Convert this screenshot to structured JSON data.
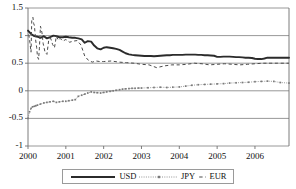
{
  "chart_data": {
    "type": "line",
    "title": "",
    "subtitle": "",
    "xlabel": "",
    "ylabel": "",
    "xlim": [
      2000.0,
      2006.9
    ],
    "ylim": [
      -1,
      1.5
    ],
    "grid": true,
    "grid_axis": "y",
    "legend_position": "bottom-center",
    "yticks": [
      1.5,
      1,
      0.5,
      0,
      -0.5,
      -1
    ],
    "ytick_labels": [
      "1.5",
      "1",
      "0.5",
      "0",
      "-0.5",
      "-1"
    ],
    "xticks": [
      2000,
      2001,
      2002,
      2003,
      2004,
      2005,
      2006
    ],
    "xtick_labels": [
      "2000",
      "2001",
      "2002",
      "2003",
      "2004",
      "2005",
      "2006"
    ],
    "series": [
      {
        "name": "USD",
        "style": "solid-thick",
        "color": "#2b2b2b",
        "x": [
          2000.0,
          2000.08,
          2000.17,
          2000.25,
          2000.33,
          2000.42,
          2000.5,
          2000.58,
          2000.67,
          2000.75,
          2000.83,
          2000.92,
          2001.0,
          2001.08,
          2001.17,
          2001.25,
          2001.33,
          2001.42,
          2001.5,
          2001.58,
          2001.67,
          2001.75,
          2001.83,
          2001.92,
          2002.0,
          2002.08,
          2002.17,
          2002.25,
          2002.33,
          2002.42,
          2002.5,
          2002.58,
          2002.67,
          2002.75,
          2002.83,
          2002.92,
          2003.0,
          2003.08,
          2003.17,
          2003.25,
          2003.33,
          2003.42,
          2003.5,
          2003.58,
          2003.67,
          2003.75,
          2003.83,
          2003.92,
          2004.0,
          2004.08,
          2004.17,
          2004.25,
          2004.33,
          2004.42,
          2004.5,
          2004.58,
          2004.67,
          2004.75,
          2004.83,
          2004.92,
          2005.0,
          2005.08,
          2005.17,
          2005.25,
          2005.33,
          2005.42,
          2005.5,
          2005.58,
          2005.67,
          2005.75,
          2005.83,
          2005.92,
          2006.0,
          2006.08,
          2006.17,
          2006.25,
          2006.33,
          2006.42,
          2006.5,
          2006.67,
          2006.9
        ],
        "y": [
          1.09,
          1.03,
          0.99,
          0.98,
          0.96,
          0.99,
          0.95,
          0.97,
          1.0,
          0.99,
          0.97,
          0.97,
          0.98,
          0.97,
          0.96,
          0.96,
          0.95,
          0.93,
          0.87,
          0.9,
          0.89,
          0.82,
          0.77,
          0.75,
          0.78,
          0.79,
          0.78,
          0.77,
          0.76,
          0.74,
          0.71,
          0.68,
          0.66,
          0.65,
          0.645,
          0.64,
          0.635,
          0.63,
          0.63,
          0.63,
          0.625,
          0.63,
          0.635,
          0.64,
          0.645,
          0.645,
          0.65,
          0.65,
          0.65,
          0.65,
          0.655,
          0.655,
          0.655,
          0.655,
          0.65,
          0.65,
          0.645,
          0.645,
          0.64,
          0.635,
          0.615,
          0.615,
          0.62,
          0.62,
          0.62,
          0.615,
          0.61,
          0.61,
          0.605,
          0.6,
          0.6,
          0.595,
          0.58,
          0.575,
          0.575,
          0.585,
          0.6,
          0.6,
          0.6,
          0.6,
          0.6
        ],
        "start_value": 1.09,
        "end_value": 0.6
      },
      {
        "name": "JPY",
        "style": "dotted-marker",
        "color": "#7a7a7a",
        "x": [
          2000.0,
          2000.04,
          2000.08,
          2000.12,
          2000.17,
          2000.21,
          2000.25,
          2000.33,
          2000.42,
          2000.5,
          2000.58,
          2000.67,
          2000.75,
          2000.83,
          2000.92,
          2001.0,
          2001.08,
          2001.17,
          2001.25,
          2001.33,
          2001.42,
          2001.5,
          2001.58,
          2001.67,
          2001.75,
          2001.83,
          2001.92,
          2002.0,
          2002.08,
          2002.17,
          2002.25,
          2002.33,
          2002.42,
          2002.5,
          2002.58,
          2002.67,
          2002.75,
          2002.83,
          2002.92,
          2003.0,
          2003.17,
          2003.33,
          2003.5,
          2003.67,
          2003.83,
          2004.0,
          2004.17,
          2004.33,
          2004.5,
          2004.67,
          2004.83,
          2005.0,
          2005.17,
          2005.33,
          2005.5,
          2005.67,
          2005.83,
          2006.0,
          2006.17,
          2006.33,
          2006.5,
          2006.67,
          2006.9
        ],
        "y": [
          -0.5,
          -0.38,
          -0.32,
          -0.29,
          -0.28,
          -0.27,
          -0.26,
          -0.24,
          -0.22,
          -0.21,
          -0.2,
          -0.19,
          -0.21,
          -0.2,
          -0.19,
          -0.19,
          -0.18,
          -0.17,
          -0.16,
          -0.1,
          -0.08,
          -0.06,
          -0.04,
          -0.02,
          -0.03,
          -0.035,
          -0.04,
          -0.03,
          -0.02,
          -0.01,
          0.0,
          0.01,
          0.02,
          0.03,
          0.035,
          0.04,
          0.045,
          0.045,
          0.05,
          0.05,
          0.055,
          0.06,
          0.065,
          0.06,
          0.065,
          0.07,
          0.085,
          0.1,
          0.11,
          0.115,
          0.12,
          0.125,
          0.13,
          0.14,
          0.145,
          0.15,
          0.155,
          0.165,
          0.17,
          0.175,
          0.17,
          0.15,
          0.14
        ],
        "start_value": -0.5,
        "end_value": 0.14
      },
      {
        "name": "EUR",
        "style": "dashed",
        "color": "#4a4a4a",
        "x": [
          2000.02,
          2000.05,
          2000.08,
          2000.1,
          2000.13,
          2000.15,
          2000.17,
          2000.2,
          2000.23,
          2000.25,
          2000.28,
          2000.3,
          2000.33,
          2000.37,
          2000.4,
          2000.45,
          2000.5,
          2000.55,
          2000.6,
          2000.65,
          2000.7,
          2000.75,
          2000.8,
          2000.85,
          2000.92,
          2001.0,
          2001.1,
          2001.2,
          2001.3,
          2001.4,
          2001.5,
          2001.6,
          2001.7,
          2001.8,
          2001.9,
          2002.0,
          2002.2,
          2002.4,
          2002.6,
          2002.8,
          2003.0,
          2003.2,
          2003.4,
          2003.6,
          2003.8,
          2004.0,
          2004.2,
          2004.4,
          2004.6,
          2004.8,
          2005.0,
          2005.2,
          2005.4,
          2005.6,
          2005.8,
          2006.0,
          2006.2,
          2006.4,
          2006.6,
          2006.9
        ],
        "y": [
          1.02,
          0.88,
          0.7,
          1.28,
          1.33,
          1.22,
          1.18,
          0.93,
          0.78,
          0.62,
          0.57,
          0.76,
          1.17,
          1.05,
          0.86,
          0.7,
          0.66,
          0.93,
          0.95,
          0.84,
          0.78,
          0.99,
          0.92,
          0.95,
          0.9,
          0.93,
          0.88,
          0.9,
          0.91,
          0.83,
          0.63,
          0.55,
          0.52,
          0.54,
          0.53,
          0.53,
          0.54,
          0.52,
          0.51,
          0.5,
          0.48,
          0.47,
          0.42,
          0.45,
          0.47,
          0.47,
          0.48,
          0.5,
          0.49,
          0.47,
          0.48,
          0.49,
          0.48,
          0.47,
          0.48,
          0.49,
          0.5,
          0.5,
          0.5,
          0.5
        ],
        "start_value": 1.02,
        "end_value": 0.5
      }
    ]
  },
  "legend": {
    "items": [
      {
        "label": "USD",
        "style": "solid-thick"
      },
      {
        "label": "JPY",
        "style": "dotted-marker"
      },
      {
        "label": "EUR",
        "style": "dashed"
      }
    ]
  },
  "axis": {
    "y_labels": [
      "1.5",
      "1",
      "0.5",
      "0",
      "-0.5",
      "-1"
    ],
    "x_labels": [
      "2000",
      "2001",
      "2002",
      "2003",
      "2004",
      "2005",
      "2006"
    ]
  },
  "colors": {
    "usd": "#2b2b2b",
    "jpy": "#7a7a7a",
    "eur": "#4a4a4a",
    "grid": "#8c8c8c",
    "frame": "#6e6e6e",
    "text": "#111111"
  }
}
